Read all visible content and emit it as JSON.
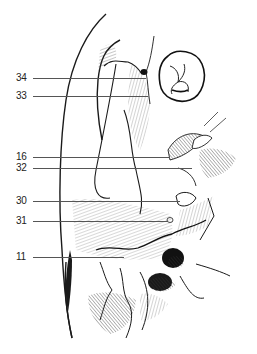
{
  "figure": {
    "line_color": "#1a1a1a",
    "leader_color": "#555555"
  },
  "labels": [
    {
      "id": "34",
      "text": "34",
      "x": 16,
      "y": 78,
      "line_start": 33,
      "line_end": 146
    },
    {
      "id": "33",
      "text": "33",
      "x": 16,
      "y": 96,
      "line_start": 33,
      "line_end": 148
    },
    {
      "id": "16",
      "text": "16",
      "x": 16,
      "y": 157,
      "line_start": 33,
      "line_end": 170
    },
    {
      "id": "32",
      "text": "32",
      "x": 16,
      "y": 168,
      "line_start": 33,
      "line_end": 192
    },
    {
      "id": "30",
      "text": "30",
      "x": 16,
      "y": 201,
      "line_start": 33,
      "line_end": 180
    },
    {
      "id": "31",
      "text": "31",
      "x": 16,
      "y": 221,
      "line_start": 33,
      "line_end": 168
    },
    {
      "id": "11",
      "text": "11",
      "x": 16,
      "y": 257,
      "line_start": 33,
      "line_end": 124
    }
  ]
}
